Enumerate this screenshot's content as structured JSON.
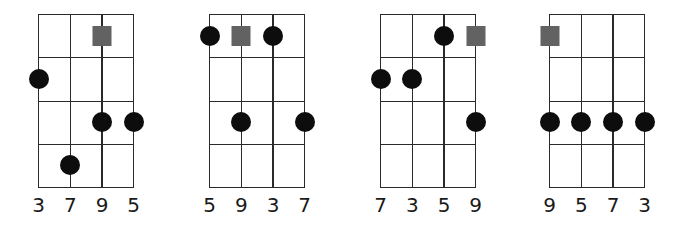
{
  "diagram": {
    "type": "chord-fingering-diagrams",
    "strings": 4,
    "frets": 4,
    "colors": {
      "line": "#2a2a2a",
      "dot": "#0d0d0d",
      "root_square": "#626262",
      "background": "#ffffff"
    },
    "charts": [
      {
        "labels": [
          "3",
          "7",
          "9",
          "5"
        ],
        "markers": [
          {
            "string": 3,
            "fret": 1,
            "type": "root-square"
          },
          {
            "string": 1,
            "fret": 2,
            "type": "dot"
          },
          {
            "string": 3,
            "fret": 3,
            "type": "dot"
          },
          {
            "string": 4,
            "fret": 3,
            "type": "dot"
          },
          {
            "string": 2,
            "fret": 4,
            "type": "dot"
          }
        ]
      },
      {
        "labels": [
          "5",
          "9",
          "3",
          "7"
        ],
        "markers": [
          {
            "string": 1,
            "fret": 1,
            "type": "dot"
          },
          {
            "string": 2,
            "fret": 1,
            "type": "root-square"
          },
          {
            "string": 3,
            "fret": 1,
            "type": "dot"
          },
          {
            "string": 2,
            "fret": 3,
            "type": "dot"
          },
          {
            "string": 4,
            "fret": 3,
            "type": "dot"
          }
        ]
      },
      {
        "labels": [
          "7",
          "3",
          "5",
          "9"
        ],
        "markers": [
          {
            "string": 3,
            "fret": 1,
            "type": "dot"
          },
          {
            "string": 4,
            "fret": 1,
            "type": "root-square"
          },
          {
            "string": 1,
            "fret": 2,
            "type": "dot"
          },
          {
            "string": 2,
            "fret": 2,
            "type": "dot"
          },
          {
            "string": 4,
            "fret": 3,
            "type": "dot"
          }
        ]
      },
      {
        "labels": [
          "9",
          "5",
          "7",
          "3"
        ],
        "markers": [
          {
            "string": 1,
            "fret": 1,
            "type": "root-square"
          },
          {
            "string": 1,
            "fret": 3,
            "type": "dot"
          },
          {
            "string": 2,
            "fret": 3,
            "type": "dot"
          },
          {
            "string": 3,
            "fret": 3,
            "type": "dot"
          },
          {
            "string": 4,
            "fret": 3,
            "type": "dot"
          }
        ]
      }
    ]
  }
}
